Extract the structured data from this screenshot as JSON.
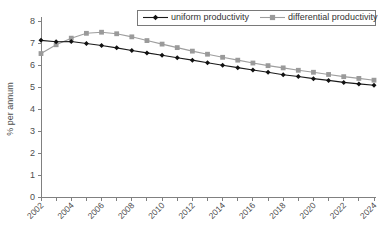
{
  "chart_data": {
    "type": "line",
    "title": "",
    "xlabel": "",
    "ylabel": "% per annum",
    "ylim": [
      0,
      8
    ],
    "ytick_step": 1,
    "yticks": [
      "0",
      "1",
      "2",
      "3",
      "4",
      "5",
      "6",
      "7",
      "8"
    ],
    "grid": false,
    "legend_position": "top-center",
    "x": [
      2002,
      2003,
      2004,
      2005,
      2006,
      2007,
      2008,
      2009,
      2010,
      2011,
      2012,
      2013,
      2014,
      2015,
      2016,
      2017,
      2018,
      2019,
      2020,
      2021,
      2022,
      2023,
      2024
    ],
    "xtick_labels": [
      "2002",
      "2004",
      "2006",
      "2008",
      "2010",
      "2012",
      "2014",
      "2016",
      "2018",
      "2020",
      "2022",
      "2024"
    ],
    "xtick_values": [
      2002,
      2004,
      2006,
      2008,
      2010,
      2012,
      2014,
      2016,
      2018,
      2020,
      2022,
      2024
    ],
    "xtick_rotation": 45,
    "series": [
      {
        "name": "uniform productivity",
        "marker": "diamond",
        "color": "#111111",
        "values": [
          7.12,
          7.06,
          7.07,
          6.98,
          6.89,
          6.78,
          6.66,
          6.55,
          6.44,
          6.33,
          6.22,
          6.1,
          5.99,
          5.88,
          5.77,
          5.67,
          5.56,
          5.48,
          5.38,
          5.3,
          5.21,
          5.14,
          5.08
        ]
      },
      {
        "name": "differential productivity",
        "marker": "square",
        "color": "#9a9a9a",
        "values": [
          6.52,
          6.92,
          7.22,
          7.44,
          7.49,
          7.42,
          7.28,
          7.11,
          6.95,
          6.79,
          6.63,
          6.49,
          6.35,
          6.22,
          6.09,
          5.97,
          5.87,
          5.76,
          5.67,
          5.57,
          5.47,
          5.39,
          5.31
        ]
      }
    ]
  },
  "legend": {
    "entries": [
      {
        "label": "uniform productivity"
      },
      {
        "label": "differential productivity"
      }
    ]
  },
  "axes": {
    "y_title": "% per annum"
  },
  "colors": {
    "uniform": "#111111",
    "differential": "#9a9a9a",
    "axis": "#808080",
    "text": "#4d4d4d",
    "background": "#ffffff"
  }
}
